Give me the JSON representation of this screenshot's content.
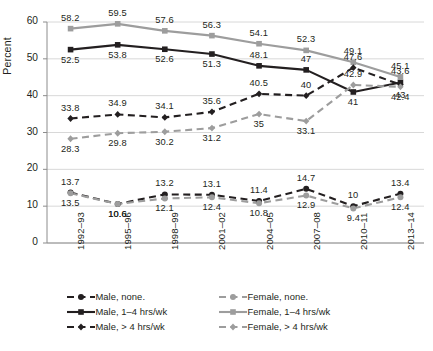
{
  "chart_data": {
    "type": "line",
    "title": "",
    "xlabel": "",
    "ylabel": "Percent",
    "ylim": [
      0,
      60
    ],
    "yticks": [
      0,
      10,
      20,
      30,
      40,
      50,
      60
    ],
    "grid": true,
    "legend_position": "bottom",
    "categories": [
      "1992–93",
      "1995–96",
      "1998–99",
      "2001–02",
      "2004–05",
      "2007–08",
      "2010–11",
      "2013–14"
    ],
    "series": [
      {
        "name": "Male, none.",
        "color": "#231f20",
        "marker": "circle",
        "dash": "dashed",
        "values": [
          13.7,
          10.6,
          13.2,
          13.1,
          11.4,
          14.7,
          10,
          13.4
        ],
        "label_side": [
          "above",
          "below",
          "above",
          "above",
          "above",
          "above",
          "above",
          "above"
        ]
      },
      {
        "name": "Female, none.",
        "color": "#9d9d9d",
        "marker": "circle",
        "dash": "dashed",
        "values": [
          13.5,
          10.6,
          12.1,
          12.4,
          10.8,
          12.9,
          9.4,
          12.4
        ],
        "label_side": [
          "below",
          "below",
          "below",
          "below",
          "below",
          "below",
          "below",
          "below"
        ]
      },
      {
        "name": "Male, 1–4 hrs/wk",
        "color": "#231f20",
        "marker": "square",
        "dash": "solid",
        "values": [
          52.5,
          53.8,
          52.6,
          51.3,
          48.1,
          47,
          41,
          43.6
        ],
        "label_side": [
          "below",
          "below",
          "below",
          "below",
          "above",
          "above",
          "below",
          "above"
        ]
      },
      {
        "name": "Female, 1–4 hrs/wk",
        "color": "#9d9d9d",
        "marker": "square",
        "dash": "solid",
        "values": [
          58.2,
          59.5,
          57.6,
          56.3,
          54.1,
          52.3,
          49.1,
          45.1
        ],
        "label_side": [
          "above",
          "above",
          "above",
          "above",
          "above",
          "above",
          "above",
          "above"
        ]
      },
      {
        "name": "Male, > 4 hrs/wk",
        "color": "#231f20",
        "marker": "diamond",
        "dash": "dashed",
        "values": [
          33.8,
          34.9,
          34.1,
          35.6,
          40.5,
          40,
          47.6,
          43
        ],
        "label_side": [
          "above",
          "above",
          "above",
          "above",
          "above",
          "above",
          "above",
          "below"
        ]
      },
      {
        "name": "Female, > 4 hrs/wk",
        "color": "#9d9d9d",
        "marker": "diamond",
        "dash": "dashed",
        "values": [
          28.3,
          29.8,
          30.2,
          31.2,
          35,
          33.1,
          42.9,
          42.4
        ],
        "label_side": [
          "below",
          "below",
          "below",
          "below",
          "below",
          "below",
          "above",
          "below"
        ]
      }
    ]
  },
  "legend": {
    "rows": [
      [
        {
          "label": "Male, none.",
          "color": "#231f20",
          "marker": "circle",
          "dash": "dashed"
        },
        {
          "label": "Female, none.",
          "color": "#9d9d9d",
          "marker": "circle",
          "dash": "dashed"
        }
      ],
      [
        {
          "label": "Male, 1–4 hrs/wk",
          "color": "#231f20",
          "marker": "square",
          "dash": "solid"
        },
        {
          "label": "Female, 1–4 hrs/wk",
          "color": "#9d9d9d",
          "marker": "square",
          "dash": "solid"
        }
      ],
      [
        {
          "label": "Male, > 4 hrs/wk",
          "color": "#231f20",
          "marker": "diamond",
          "dash": "dashed"
        },
        {
          "label": "Female, > 4 hrs/wk",
          "color": "#9d9d9d",
          "marker": "diamond",
          "dash": "dashed"
        }
      ]
    ]
  },
  "caption": {
    "text": ""
  },
  "colors": {
    "male": "#231f20",
    "female": "#9d9d9d",
    "grid": "#d8d8d8",
    "axis": "#8c8c8c"
  }
}
